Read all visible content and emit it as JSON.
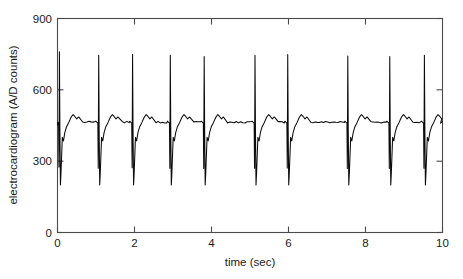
{
  "chart_data": {
    "type": "line",
    "title": "",
    "subtitle": "",
    "xlabel": "time (sec)",
    "ylabel": "electrocardiogram (A/D counts)",
    "xlim": [
      0,
      10
    ],
    "ylim": [
      0,
      900
    ],
    "xticks": [
      0,
      2,
      4,
      6,
      8,
      10
    ],
    "xticklabels": [
      "0",
      "2",
      "4",
      "6",
      "8",
      "10"
    ],
    "yticks": [
      0,
      300,
      600,
      900
    ],
    "yticklabels": [
      "0",
      "300",
      "600",
      "900"
    ],
    "grid": false,
    "legend": null,
    "legend_position": "none",
    "box": true,
    "series": [
      {
        "name": "electrocardiogram",
        "color": "#0b0b0b",
        "units": "A/D counts",
        "sampling_note": "ECG record, 10 s shown",
        "baseline": 470,
        "r_peak_amplitude": 745,
        "s_trough_amplitude": 200,
        "q_trough_amplitude": 390,
        "t_wave_amplitude": 490,
        "beat_count": 10,
        "mean_rr_interval_sec": 1.07,
        "approx_heart_rate_bpm": 56,
        "r_peak_times_sec": [
          0.05,
          1.07,
          1.95,
          2.93,
          3.81,
          5.13,
          5.98,
          7.54,
          8.63,
          9.53
        ],
        "r_peak_values": [
          760,
          745,
          750,
          745,
          740,
          745,
          748,
          742,
          740,
          745
        ]
      }
    ]
  },
  "axes": {
    "x_label": "time (sec)",
    "y_label": "electrocardiogram (A/D counts)",
    "x_tick_labels": [
      "0",
      "2",
      "4",
      "6",
      "8",
      "10"
    ],
    "y_tick_labels": [
      "0",
      "300",
      "600",
      "900"
    ]
  },
  "colors": {
    "trace": "#0b0b0b",
    "axis": "#4a4a4a",
    "text": "#1a1a1a",
    "background": "#ffffff"
  }
}
